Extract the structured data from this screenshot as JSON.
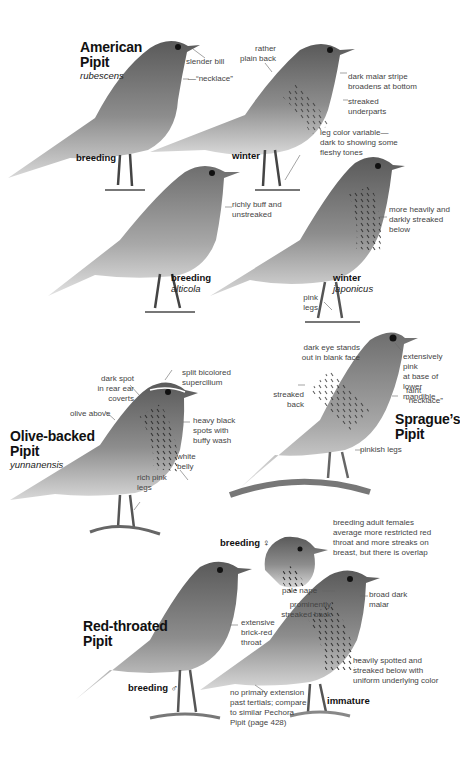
{
  "species": [
    {
      "name_line1": "American",
      "name_line2": "Pipit",
      "subspecies": "rubescens",
      "figures": [
        {
          "plumage": "breeding",
          "notes": [
            "slender bill",
            "—“necklace”"
          ]
        },
        {
          "plumage": "winter",
          "notes": [
            "rather\nplain back",
            "dark malar stripe\nbroadens at bottom",
            "streaked\nunderparts",
            "leg color variable—\ndark to showing some\nfleshy tones"
          ]
        },
        {
          "plumage": "breeding",
          "subspecies": "alticola",
          "notes": [
            "richly buff and\nunstreaked"
          ]
        },
        {
          "plumage": "winter",
          "subspecies": "japonicus",
          "notes": [
            "more heavily and\ndarkly streaked\nbelow",
            "pink\nlegs"
          ]
        }
      ]
    },
    {
      "name_line1": "Olive-backed",
      "name_line2": "Pipit",
      "subspecies": "yunnanensis",
      "notes": [
        "dark spot\nin rear ear\ncoverts",
        "split bicolored\nsupercilium",
        "olive above",
        "heavy black\nspots with\nbuffy wash",
        "white\nbelly",
        "rich pink\nlegs"
      ]
    },
    {
      "name_line1": "Sprague’s",
      "name_line2": "Pipit",
      "notes": [
        "dark eye stands\nout in blank face",
        "extensively pink\nat base of lower\nmandible",
        "streaked\nback",
        "faint\n“necklace”",
        "pinkish legs"
      ]
    },
    {
      "name_line1": "Red-throated",
      "name_line2": "Pipit",
      "figures": [
        {
          "plumage": "breeding ♀",
          "notes": [
            "breeding adult females\naverage more restricted red\nthroat and more streaks on\nbreast, but there is overlap"
          ]
        },
        {
          "plumage": "breeding ♂",
          "notes": [
            "pale nape",
            "prominently\nstreaked back",
            "extensive\nbrick-red\nthroat"
          ]
        },
        {
          "plumage": "immature",
          "notes": [
            "broad dark\nmalar",
            "heavily spotted and\nstreaked below with\nuniform underlying color",
            "no primary extension\npast tertials; compare\nto similar Pechora\nPipit (page 428)"
          ]
        }
      ]
    }
  ],
  "colors": {
    "background": "#ffffff",
    "ink": "#111111",
    "note": "#444444",
    "bird_dark": "#3a3a3a",
    "bird_mid": "#8a8a8a",
    "bird_light": "#d6d6d6"
  }
}
